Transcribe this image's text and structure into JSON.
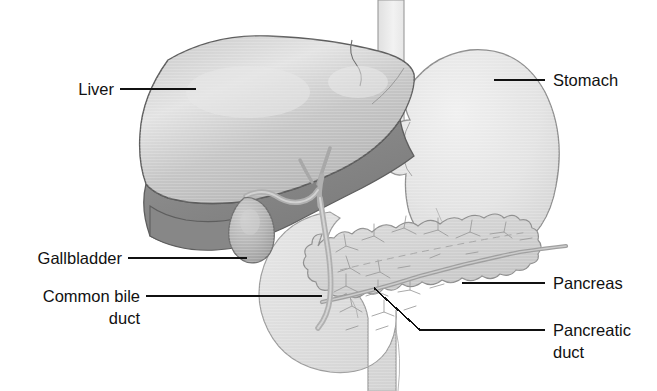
{
  "figure": {
    "background_color": "#ffffff",
    "width": 657,
    "height": 391
  },
  "labels": {
    "liver": "Liver",
    "gallbladder": "Gallbladder",
    "common_bile_duct_line1": "Common bile",
    "common_bile_duct_line2": "duct",
    "stomach": "Stomach",
    "pancreas": "Pancreas",
    "pancreatic_duct_line1": "Pancreatic",
    "pancreatic_duct_line2": "duct"
  },
  "colors": {
    "outline": "#6b6b6b",
    "leader_line": "#111111",
    "text": "#111111",
    "liver_light": "#c4c4c4",
    "liver_highlight": "#e2e2e2",
    "liver_dark": "#8a8a8a",
    "stomach": "#e4e4e4",
    "duodenum": "#dcdcdc",
    "pancreas": "#d2d2d2",
    "gallbladder": "#b4b4b4",
    "duct": "#b8b8b8",
    "esophagus": "#ececec"
  },
  "structures": [
    {
      "name": "esophagus",
      "tone": "#ececec"
    },
    {
      "name": "liver",
      "tone": "#c4c4c4"
    },
    {
      "name": "liver-posterior-lobe",
      "tone": "#8a8a8a"
    },
    {
      "name": "stomach",
      "tone": "#e4e4e4"
    },
    {
      "name": "gallbladder",
      "tone": "#b4b4b4"
    },
    {
      "name": "cystic-duct",
      "tone": "#b8b8b8"
    },
    {
      "name": "common-bile-duct",
      "tone": "#b8b8b8"
    },
    {
      "name": "duodenum",
      "tone": "#dcdcdc"
    },
    {
      "name": "pancreas",
      "tone": "#d2d2d2"
    },
    {
      "name": "pancreatic-duct",
      "tone": "#b0b0b0"
    }
  ]
}
